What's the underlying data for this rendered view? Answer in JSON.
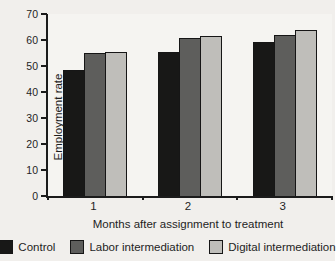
{
  "chart_data": {
    "type": "bar",
    "title": "",
    "categories": [
      "1",
      "2",
      "3"
    ],
    "series": [
      {
        "name": "Control",
        "color": "#181817",
        "values": [
          48,
          55,
          59
        ]
      },
      {
        "name": "Labor intermediation",
        "color": "#5e5e5c",
        "values": [
          54.5,
          60.5,
          61.5
        ]
      },
      {
        "name": "Digital intermediation",
        "color": "#bfbeba",
        "values": [
          55,
          61,
          63.5
        ]
      }
    ],
    "xlabel": "Months after assignment to treatment",
    "ylabel": "Employment rate",
    "ylim": [
      0,
      70
    ],
    "yticks": [
      0,
      10,
      20,
      30,
      40,
      50,
      60,
      70
    ],
    "grid": false,
    "legend_position": "bottom",
    "bar_outline_color": "#161616",
    "axis_color": "#1b1b1b",
    "background_color": "#f1efec"
  }
}
